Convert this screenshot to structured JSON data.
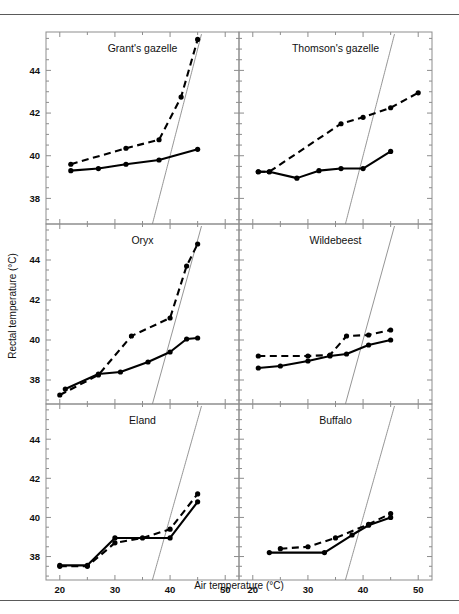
{
  "figure": {
    "x_axis_title": "Air temperature (°C)",
    "y_axis_title": "Rectal temperature (°C)",
    "x_ticks": [
      20,
      30,
      40,
      50
    ],
    "x_tick_labels": [
      "20",
      "30",
      "40",
      "50"
    ],
    "y_ticks": [
      38,
      40,
      42,
      44
    ],
    "y_tick_labels": [
      "38",
      "40",
      "42",
      "44"
    ],
    "x_minor_step": 5,
    "y_minor_step": 0.5,
    "xlim": [
      17.5,
      52.5
    ],
    "ylim": [
      36.8,
      45.8
    ],
    "identity_line": true,
    "grid": false,
    "line_color": "#000000",
    "frame_color": "#8d8d8d",
    "identity_color": "#7a7a7a"
  },
  "chart_data": {
    "type": "line",
    "title": "",
    "subtitle": "",
    "xlabel": "Air temperature (°C)",
    "ylabel": "Rectal temperature (°C)",
    "xlim": [
      17.5,
      52.5
    ],
    "ylim": [
      36.8,
      45.8
    ],
    "grid": false,
    "legend_position": "none",
    "annotations": [
      "Thin diagonal line in each panel is the line of equality (rectal temperature = air temperature)"
    ],
    "panels": [
      {
        "id": "grants-gazelle",
        "label": "Grant's gazelle",
        "row": 0,
        "col": 0,
        "series": [
          {
            "name": "hydrated",
            "style": "solid",
            "x": [
              22,
              27,
              32,
              38,
              45
            ],
            "y": [
              39.3,
              39.4,
              39.6,
              39.8,
              40.3
            ]
          },
          {
            "name": "dehydrated",
            "style": "dashed",
            "x": [
              22,
              32,
              38,
              42,
              45
            ],
            "y": [
              39.6,
              40.35,
              40.75,
              42.75,
              45.45
            ]
          }
        ]
      },
      {
        "id": "thomsons-gazelle",
        "label": "Thomson's gazelle",
        "row": 0,
        "col": 1,
        "series": [
          {
            "name": "hydrated",
            "style": "solid",
            "x": [
              21,
              23,
              28,
              32,
              36,
              40,
              45
            ],
            "y": [
              39.25,
              39.25,
              38.95,
              39.3,
              39.4,
              39.4,
              40.2
            ]
          },
          {
            "name": "dehydrated",
            "style": "dashed",
            "x": [
              21,
              23,
              36,
              40,
              45,
              50
            ],
            "y": [
              39.25,
              39.25,
              41.5,
              41.8,
              42.25,
              42.95
            ]
          }
        ]
      },
      {
        "id": "oryx",
        "label": "Oryx",
        "row": 1,
        "col": 0,
        "series": [
          {
            "name": "hydrated",
            "style": "solid",
            "x": [
              21,
              27,
              31,
              36,
              40,
              43,
              45
            ],
            "y": [
              37.55,
              38.3,
              38.4,
              38.9,
              39.4,
              40.05,
              40.1
            ]
          },
          {
            "name": "dehydrated",
            "style": "dashed",
            "x": [
              20,
              27,
              33,
              40,
              43,
              45
            ],
            "y": [
              37.25,
              38.25,
              40.2,
              41.1,
              43.7,
              44.8
            ]
          }
        ]
      },
      {
        "id": "wildebeest",
        "label": "Wildebeest",
        "row": 1,
        "col": 1,
        "series": [
          {
            "name": "hydrated",
            "style": "solid",
            "x": [
              21,
              25,
              30,
              34,
              37,
              41,
              45
            ],
            "y": [
              38.6,
              38.7,
              38.95,
              39.2,
              39.3,
              39.75,
              40.0
            ]
          },
          {
            "name": "dehydrated",
            "style": "dashed",
            "x": [
              21,
              30,
              34,
              37,
              41,
              45
            ],
            "y": [
              39.2,
              39.2,
              39.25,
              40.2,
              40.25,
              40.5
            ]
          }
        ]
      },
      {
        "id": "eland",
        "label": "Eland",
        "row": 2,
        "col": 0,
        "series": [
          {
            "name": "hydrated",
            "style": "solid",
            "x": [
              20,
              25,
              30,
              40,
              45
            ],
            "y": [
              37.55,
              37.55,
              38.95,
              38.95,
              40.8
            ]
          },
          {
            "name": "dehydrated",
            "style": "dashed",
            "x": [
              20,
              25,
              30,
              35,
              40,
              45
            ],
            "y": [
              37.5,
              37.5,
              38.7,
              38.95,
              39.4,
              41.2
            ]
          }
        ]
      },
      {
        "id": "buffalo",
        "label": "Buffalo",
        "row": 2,
        "col": 1,
        "series": [
          {
            "name": "hydrated",
            "style": "solid",
            "x": [
              23,
              33,
              38,
              41,
              45
            ],
            "y": [
              38.2,
              38.2,
              39.1,
              39.6,
              40.0
            ]
          },
          {
            "name": "dehydrated",
            "style": "dashed",
            "x": [
              25,
              30,
              35,
              41,
              45
            ],
            "y": [
              38.4,
              38.5,
              38.95,
              39.65,
              40.2
            ]
          }
        ]
      }
    ]
  }
}
